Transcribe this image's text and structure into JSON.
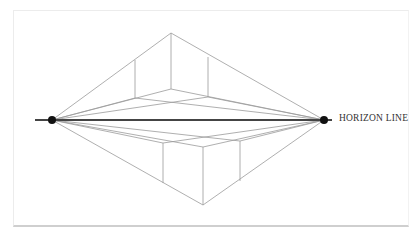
{
  "diagram": {
    "horizon_label": "HORIZON LINE",
    "colors": {
      "construction_line": "#9a9a9a",
      "horizon_line": "#444444",
      "vanishing_point": "#111111",
      "frame_border": "#e5e5e5",
      "label_text": "#333333"
    },
    "vanishing_points": [
      {
        "name": "left",
        "x": 52,
        "y": 120
      },
      {
        "name": "right",
        "x": 324,
        "y": 120
      }
    ],
    "horizon": {
      "x1": 35,
      "x2": 332,
      "y": 120
    },
    "cubes": [
      {
        "name": "above-horizon-cube",
        "near_edge_x": 171,
        "top_y": 33,
        "bottom_y": 89
      },
      {
        "name": "below-horizon-cube",
        "near_edge_x": 203,
        "top_y": 147,
        "bottom_y": 205
      }
    ]
  }
}
